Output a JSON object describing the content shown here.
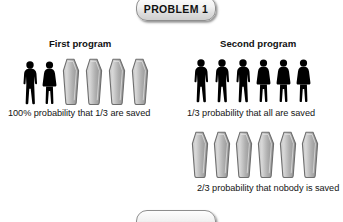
{
  "badges": {
    "top": {
      "label": "PROBLEM 1"
    },
    "bottom": {
      "label": ""
    }
  },
  "columns": {
    "first": {
      "heading": "First program",
      "caption": "100% probability that 1/3 are saved",
      "survivors": [
        "man",
        "woman"
      ],
      "coffins": 4,
      "total_people": 6
    },
    "second": {
      "heading": "Second program",
      "outcome_a": {
        "caption": "1/3 probability that all are saved",
        "survivors": [
          "man",
          "man",
          "man",
          "woman",
          "woman",
          "woman"
        ],
        "coffins": 0
      },
      "outcome_b": {
        "caption": "2/3 probability that nobody is saved",
        "survivors": [],
        "coffins": 6
      }
    }
  },
  "icons": {
    "man": "man-silhouette-icon",
    "woman": "woman-silhouette-icon",
    "coffin": "coffin-icon"
  },
  "colors": {
    "silhouette": "#000000",
    "coffin_fill_light": "#d8d8d8",
    "coffin_fill_dark": "#8f8f8f",
    "coffin_outline": "#6e6e6e",
    "badge_border": "#8e8e8e",
    "background": "#ffffff",
    "text": "#111111"
  }
}
